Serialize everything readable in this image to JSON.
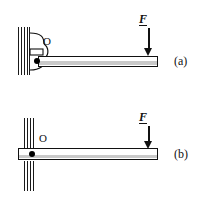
{
  "figure": {
    "background_color": "#ffffff",
    "ink_color": "#111111",
    "beam_shade_color": "#c9c9c9",
    "panels": [
      {
        "id": "a",
        "caption": "(a)",
        "pivot_label": "O",
        "force_label": "F",
        "force_direction": "down",
        "support_type": "wall-bracket-hinge",
        "beam_orientation": "horizontal"
      },
      {
        "id": "b",
        "caption": "(b)",
        "pivot_label": "O",
        "force_label": "F",
        "force_direction": "down",
        "support_type": "wall-through-slot",
        "beam_orientation": "horizontal"
      }
    ]
  }
}
